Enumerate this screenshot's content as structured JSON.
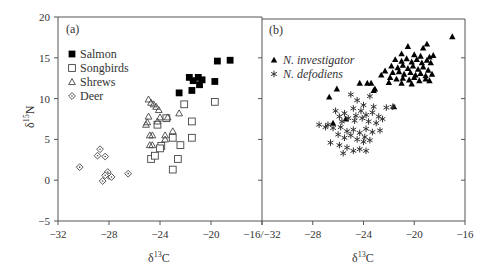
{
  "chart_data": [
    {
      "panel": "(a)",
      "type": "scatter",
      "xlabel": "δ13C",
      "ylabel": "δ15N",
      "xlim": [
        -32,
        -16
      ],
      "ylim": [
        -5,
        20
      ],
      "xticks": [
        -32,
        -28,
        -24,
        -20,
        -16
      ],
      "yticks": [
        -5,
        0,
        5,
        10,
        15,
        20
      ],
      "xtick_labels": [
        "−32",
        "−28",
        "−24",
        "−20",
        "−16/−32"
      ],
      "ytick_labels": [
        "−5",
        "0",
        "5",
        "10",
        "15",
        "20"
      ],
      "grid": false,
      "legend_position": "upper-left",
      "series": [
        {
          "name": "Salmon",
          "marker": "filled-square",
          "points": [
            [
              -19.5,
              14.6
            ],
            [
              -18.5,
              14.7
            ],
            [
              -21.7,
              12.6
            ],
            [
              -21.4,
              12.2
            ],
            [
              -21.0,
              12.6
            ],
            [
              -20.7,
              12.3
            ],
            [
              -20.9,
              11.7
            ],
            [
              -19.7,
              12.1
            ],
            [
              -22.5,
              10.7
            ],
            [
              -21.5,
              11.0
            ]
          ]
        },
        {
          "name": "Songbirds",
          "marker": "open-square",
          "points": [
            [
              -22.1,
              9.3
            ],
            [
              -19.7,
              9.6
            ],
            [
              -23.5,
              7.6
            ],
            [
              -21.5,
              7.2
            ],
            [
              -24.2,
              6.8
            ],
            [
              -23.0,
              5.2
            ],
            [
              -21.5,
              5.2
            ],
            [
              -23.9,
              4.2
            ],
            [
              -24.0,
              3.9
            ],
            [
              -24.7,
              2.6
            ],
            [
              -22.6,
              2.6
            ],
            [
              -23.0,
              1.3
            ],
            [
              -24.4,
              3.0
            ],
            [
              -22.4,
              4.3
            ]
          ]
        },
        {
          "name": "Shrews",
          "marker": "open-triangle",
          "points": [
            [
              -24.9,
              9.9
            ],
            [
              -24.7,
              9.5
            ],
            [
              -24.5,
              9.3
            ],
            [
              -24.3,
              9.0
            ],
            [
              -24.1,
              8.6
            ],
            [
              -24.9,
              7.8
            ],
            [
              -24.0,
              7.7
            ],
            [
              -23.4,
              7.7
            ],
            [
              -22.5,
              8.2
            ],
            [
              -25.0,
              7.1
            ],
            [
              -25.1,
              6.8
            ],
            [
              -24.2,
              7.2
            ],
            [
              -24.8,
              5.5
            ],
            [
              -24.6,
              5.5
            ],
            [
              -23.6,
              5.5
            ],
            [
              -23.0,
              6.0
            ],
            [
              -23.6,
              5.0
            ],
            [
              -24.8,
              4.3
            ],
            [
              -24.6,
              4.3
            ]
          ]
        },
        {
          "name": "Deer",
          "marker": "open-diamond",
          "points": [
            [
              -30.3,
              1.6
            ],
            [
              -28.7,
              3.8
            ],
            [
              -28.9,
              3.0
            ],
            [
              -28.3,
              2.9
            ],
            [
              -28.1,
              1.0
            ],
            [
              -28.0,
              0.5
            ],
            [
              -27.8,
              0.4
            ],
            [
              -28.3,
              0.6
            ],
            [
              -28.5,
              -0.1
            ],
            [
              -26.5,
              0.8
            ]
          ]
        }
      ]
    },
    {
      "panel": "(b)",
      "type": "scatter",
      "xlabel": "δ13C",
      "ylabel": "",
      "xlim": [
        -32,
        -16
      ],
      "ylim": [
        -5,
        20
      ],
      "xticks": [
        -32,
        -28,
        -24,
        -20,
        -16
      ],
      "xtick_labels": [
        "",
        "−28",
        "−24",
        "−20",
        "−16"
      ],
      "grid": false,
      "legend_position": "upper-left",
      "series": [
        {
          "name": "N. investigator",
          "marker": "filled-triangle",
          "points": [
            [
              -17.0,
              17.6
            ],
            [
              -20.5,
              16.4
            ],
            [
              -19.3,
              16.2
            ],
            [
              -19.0,
              16.7
            ],
            [
              -21.0,
              15.5
            ],
            [
              -20.0,
              15.4
            ],
            [
              -19.5,
              15.2
            ],
            [
              -18.8,
              15.1
            ],
            [
              -18.5,
              15.3
            ],
            [
              -21.5,
              14.8
            ],
            [
              -21.0,
              14.6
            ],
            [
              -20.6,
              14.9
            ],
            [
              -20.2,
              14.5
            ],
            [
              -19.8,
              14.8
            ],
            [
              -19.4,
              14.4
            ],
            [
              -19.0,
              14.7
            ],
            [
              -18.7,
              14.4
            ],
            [
              -21.8,
              14.0
            ],
            [
              -21.3,
              13.8
            ],
            [
              -20.9,
              14.1
            ],
            [
              -20.5,
              13.7
            ],
            [
              -20.1,
              14.0
            ],
            [
              -19.7,
              13.6
            ],
            [
              -19.3,
              13.9
            ],
            [
              -18.9,
              13.5
            ],
            [
              -22.3,
              13.4
            ],
            [
              -21.7,
              13.2
            ],
            [
              -21.2,
              13.3
            ],
            [
              -20.8,
              13.0
            ],
            [
              -20.3,
              13.2
            ],
            [
              -19.9,
              12.9
            ],
            [
              -19.5,
              13.1
            ],
            [
              -19.1,
              12.8
            ],
            [
              -18.6,
              13.0
            ],
            [
              -22.6,
              12.9
            ],
            [
              -21.9,
              12.6
            ],
            [
              -21.4,
              12.4
            ],
            [
              -20.9,
              12.5
            ],
            [
              -20.4,
              12.3
            ],
            [
              -20.0,
              12.6
            ],
            [
              -19.6,
              12.2
            ],
            [
              -19.1,
              12.4
            ],
            [
              -21.0,
              11.9
            ],
            [
              -20.2,
              11.8
            ],
            [
              -18.8,
              12.2
            ],
            [
              -22.0,
              12.0
            ],
            [
              -26.1,
              11.2
            ],
            [
              -26.7,
              10.2
            ],
            [
              -24.3,
              11.9
            ],
            [
              -23.7,
              11.9
            ],
            [
              -23.4,
              11.9
            ],
            [
              -23.2,
              11.0
            ],
            [
              -23.1,
              11.2
            ],
            [
              -21.6,
              9.0
            ],
            [
              -26.4,
              7.0
            ],
            [
              -25.4,
              7.5
            ]
          ]
        },
        {
          "name": "N. defodiens",
          "marker": "asterisk",
          "points": [
            [
              -25.0,
              10.5
            ],
            [
              -24.5,
              9.8
            ],
            [
              -24.0,
              9.2
            ],
            [
              -23.5,
              10.3
            ],
            [
              -23.2,
              9.0
            ],
            [
              -24.8,
              8.8
            ],
            [
              -24.2,
              8.5
            ],
            [
              -23.8,
              8.0
            ],
            [
              -23.3,
              8.3
            ],
            [
              -22.8,
              7.8
            ],
            [
              -25.5,
              8.2
            ],
            [
              -25.9,
              7.8
            ],
            [
              -26.2,
              8.5
            ],
            [
              -25.7,
              7.2
            ],
            [
              -25.2,
              7.6
            ],
            [
              -24.7,
              7.3
            ],
            [
              -24.1,
              7.6
            ],
            [
              -23.6,
              7.2
            ],
            [
              -23.0,
              7.0
            ],
            [
              -22.5,
              7.5
            ],
            [
              -26.8,
              6.8
            ],
            [
              -26.4,
              6.4
            ],
            [
              -25.8,
              6.5
            ],
            [
              -25.3,
              6.0
            ],
            [
              -24.8,
              6.2
            ],
            [
              -24.3,
              5.8
            ],
            [
              -23.8,
              6.3
            ],
            [
              -23.3,
              5.9
            ],
            [
              -22.7,
              6.1
            ],
            [
              -27.5,
              6.8
            ],
            [
              -27.0,
              6.5
            ],
            [
              -26.0,
              5.6
            ],
            [
              -25.5,
              5.2
            ],
            [
              -25.0,
              5.5
            ],
            [
              -24.5,
              5.0
            ],
            [
              -24.0,
              4.7
            ],
            [
              -23.5,
              4.9
            ],
            [
              -26.6,
              4.6
            ],
            [
              -25.9,
              4.3
            ],
            [
              -25.3,
              4.0
            ],
            [
              -24.8,
              3.6
            ],
            [
              -24.3,
              3.8
            ],
            [
              -23.8,
              3.6
            ],
            [
              -22.2,
              8.9
            ],
            [
              -21.7,
              9.0
            ],
            [
              -25.6,
              3.3
            ],
            [
              -24.6,
              7.9
            ],
            [
              -23.9,
              5.3
            ]
          ]
        }
      ]
    }
  ],
  "panels": {
    "a": {
      "label": "(a)",
      "xlabel_base": "δ",
      "xlabel_sup": "13",
      "xlabel_el": "C",
      "ylabel_base": "δ",
      "ylabel_sup": "15",
      "ylabel_el": "N",
      "legend": [
        "Salmon",
        "Songbirds",
        "Shrews",
        "Deer"
      ]
    },
    "b": {
      "label": "(b)",
      "xlabel_base": "δ",
      "xlabel_sup": "13",
      "xlabel_el": "C",
      "legend": [
        "N. investigator",
        "N. defodiens"
      ]
    }
  }
}
